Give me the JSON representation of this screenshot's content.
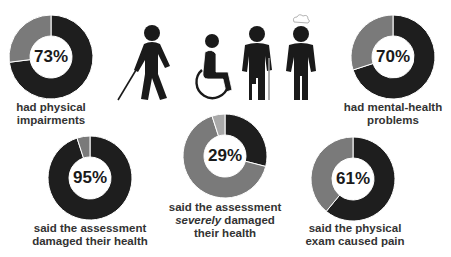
{
  "colors": {
    "dark": "#1e1e1e",
    "mid": "#7a7a7a",
    "light": "#a9a9a9",
    "separator": "#ffffff",
    "text": "#333333"
  },
  "icons": [
    {
      "name": "blind-person-with-cane-icon"
    },
    {
      "name": "wheelchair-user-icon"
    },
    {
      "name": "amputee-with-crutch-icon"
    },
    {
      "name": "person-with-thought-cloud-icon"
    }
  ],
  "stats": {
    "physical": {
      "pct_label": "73%",
      "line1": "had physical",
      "line2": "impairments"
    },
    "mental": {
      "pct_label": "70%",
      "line1": "had mental-health",
      "line2": "problems"
    },
    "damaged": {
      "pct_label": "95%",
      "line1": "said the assessment",
      "line2": "damaged their health"
    },
    "severe": {
      "pct_label": "29%",
      "line1": "said the assessment",
      "line2_em": "severely",
      "line2_rest": " damaged",
      "line3": "their health"
    },
    "pain": {
      "pct_label": "61%",
      "line1": "said the physical",
      "line2": "exam caused pain"
    }
  },
  "chart_data": [
    {
      "type": "pie",
      "title": "had physical impairments",
      "center_label": "73%",
      "categories": [
        "Yes",
        "No"
      ],
      "values": [
        73,
        27
      ],
      "colors": [
        "#1e1e1e",
        "#7a7a7a"
      ]
    },
    {
      "type": "pie",
      "title": "had mental-health problems",
      "center_label": "70%",
      "categories": [
        "Yes",
        "No"
      ],
      "values": [
        70,
        30
      ],
      "colors": [
        "#1e1e1e",
        "#7a7a7a"
      ]
    },
    {
      "type": "pie",
      "title": "said the assessment damaged their health",
      "center_label": "95%",
      "categories": [
        "Yes",
        "No"
      ],
      "values": [
        95,
        5
      ],
      "colors": [
        "#1e1e1e",
        "#7a7a7a"
      ]
    },
    {
      "type": "pie",
      "title": "said the assessment severely damaged their health",
      "center_label": "29%",
      "categories": [
        "Severely damaged",
        "Damaged (not severely)",
        "Not damaged"
      ],
      "values": [
        29,
        66,
        5
      ],
      "colors": [
        "#1e1e1e",
        "#7a7a7a",
        "#a9a9a9"
      ]
    },
    {
      "type": "pie",
      "title": "said the physical exam caused pain",
      "center_label": "61%",
      "categories": [
        "Yes",
        "No"
      ],
      "values": [
        61,
        39
      ],
      "colors": [
        "#1e1e1e",
        "#7a7a7a"
      ]
    }
  ]
}
